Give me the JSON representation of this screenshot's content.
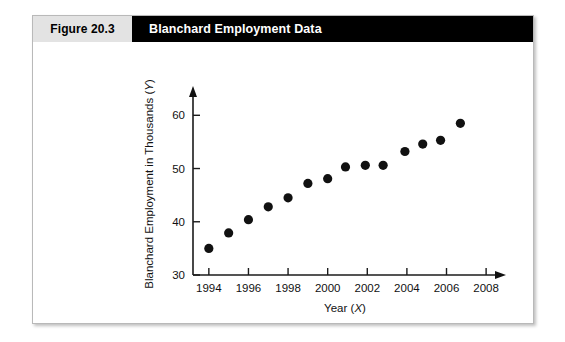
{
  "figure": {
    "number_label": "Figure 20.3",
    "title": "Blanchard Employment Data"
  },
  "chart_data": {
    "type": "scatter",
    "title": "Blanchard Employment Data",
    "xlabel": "Year (X)",
    "ylabel": "Blanchard Employment in Thousands (Y)",
    "xlim": [
      1993.2,
      2008.6
    ],
    "ylim": [
      30,
      64
    ],
    "grid": false,
    "legend": "none",
    "xticks": [
      1994,
      1996,
      1998,
      2000,
      2002,
      2004,
      2006,
      2008
    ],
    "xtick_labels": [
      "1994",
      "1996",
      "1998",
      "2000",
      "2002",
      "2004",
      "2006",
      "2008"
    ],
    "yticks": [
      30,
      40,
      50,
      60
    ],
    "ytick_labels": [
      "30",
      "40",
      "50",
      "60"
    ],
    "x": [
      1994.0,
      1995.0,
      1996.0,
      1997.0,
      1998.0,
      1999.0,
      2000.0,
      2000.9,
      2001.9,
      2002.8,
      2003.9,
      2004.8,
      2005.7,
      2006.7
    ],
    "y": [
      35.0,
      37.9,
      40.4,
      42.8,
      44.5,
      47.2,
      48.1,
      50.3,
      50.6,
      50.6,
      53.2,
      54.6,
      55.3,
      58.5
    ],
    "points": [
      {
        "year": 1994.0,
        "employment": 35.0
      },
      {
        "year": 1995.0,
        "employment": 37.9
      },
      {
        "year": 1996.0,
        "employment": 40.4
      },
      {
        "year": 1997.0,
        "employment": 42.8
      },
      {
        "year": 1998.0,
        "employment": 44.5
      },
      {
        "year": 1999.0,
        "employment": 47.2
      },
      {
        "year": 2000.0,
        "employment": 48.1
      },
      {
        "year": 2000.9,
        "employment": 50.3
      },
      {
        "year": 2001.9,
        "employment": 50.6
      },
      {
        "year": 2002.8,
        "employment": 50.6
      },
      {
        "year": 2003.9,
        "employment": 53.2
      },
      {
        "year": 2004.8,
        "employment": 54.6
      },
      {
        "year": 2005.7,
        "employment": 55.3
      },
      {
        "year": 2006.7,
        "employment": 58.5
      }
    ],
    "marker": {
      "shape": "circle",
      "color": "#111111",
      "size": 4.6
    },
    "axis_color": "#1b1b1b"
  }
}
